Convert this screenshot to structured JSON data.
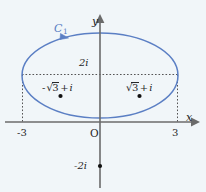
{
  "figure": {
    "kind": "complex-plane-contour-diagram",
    "background_color": "#f1f6f9",
    "width": 206,
    "height": 192
  },
  "colors": {
    "contour": "#5b7fc4",
    "axis": "#6b6b6b",
    "guide": "#555555",
    "text": "#262626",
    "point": "#111111"
  },
  "axes": {
    "x_label": "x",
    "y_label": "y",
    "origin_label": "O",
    "x_ticks": [
      {
        "label": "-3",
        "value": -3
      },
      {
        "label": "3",
        "value": 3
      }
    ],
    "y_ticks": [
      {
        "label": "2i",
        "value": 2
      },
      {
        "label": "-2i",
        "value": -2
      }
    ]
  },
  "contour": {
    "label": "C",
    "label_subscript": "1",
    "shape": "ellipse",
    "orientation": "clockwise",
    "semi_axis_x": 3,
    "semi_axis_y": 2,
    "center": [
      0,
      0
    ]
  },
  "points": [
    {
      "id": "left-point",
      "sign": "-",
      "radical_symbol": "√",
      "radicand": "3",
      "operator": "+",
      "imaginary": "i",
      "value_text": "-√3 + i"
    },
    {
      "id": "right-point",
      "sign": "",
      "radical_symbol": "√",
      "radicand": "3",
      "operator": "+",
      "imaginary": "i",
      "value_text": "√3 + i"
    }
  ],
  "marked_axis_point": {
    "label": "-2i",
    "on_axis": "y",
    "value": -2
  }
}
